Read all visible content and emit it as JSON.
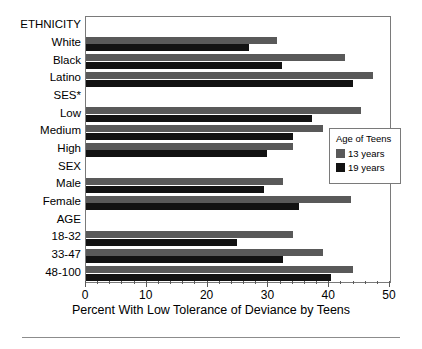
{
  "chart_data": {
    "type": "bar",
    "orientation": "horizontal",
    "title": "",
    "xlabel": "Percent With Low Tolerance of Deviance by Teens",
    "ylabel": "",
    "xlim": [
      0,
      50
    ],
    "xticks": [
      0,
      10,
      20,
      30,
      40,
      50
    ],
    "xtick_labels": [
      "0",
      "10",
      "20",
      "30",
      "40",
      "50"
    ],
    "minor_tick_step": 2,
    "grid": false,
    "legend": {
      "title": "Age of Teens",
      "position": "center-right",
      "entries": [
        {
          "label": "13 years",
          "color": "#595959"
        },
        {
          "label": "19 years",
          "color": "#121212"
        }
      ]
    },
    "categories": [
      "ETHNICITY",
      "White",
      "Black",
      "Latino",
      "SES*",
      "Low",
      "Medium",
      "High",
      "SEX",
      "Male",
      "Female",
      "AGE",
      "18-32",
      "33-47",
      "48-100"
    ],
    "group_headers": [
      "ETHNICITY",
      "SES*",
      "SEX",
      "AGE"
    ],
    "series": [
      {
        "name": "13 years",
        "color": "#595959",
        "values": [
          null,
          31.4,
          42.6,
          47.2,
          null,
          45.2,
          39.0,
          34.0,
          null,
          32.4,
          43.6,
          null,
          34.0,
          39.0,
          43.9
        ]
      },
      {
        "name": "19 years",
        "color": "#121212",
        "values": [
          null,
          26.8,
          32.2,
          43.9,
          null,
          37.2,
          34.0,
          29.8,
          null,
          29.3,
          35.0,
          null,
          24.8,
          32.4,
          40.3
        ]
      }
    ]
  },
  "axis_title": "Percent With Low Tolerance of Deviance by Teens"
}
